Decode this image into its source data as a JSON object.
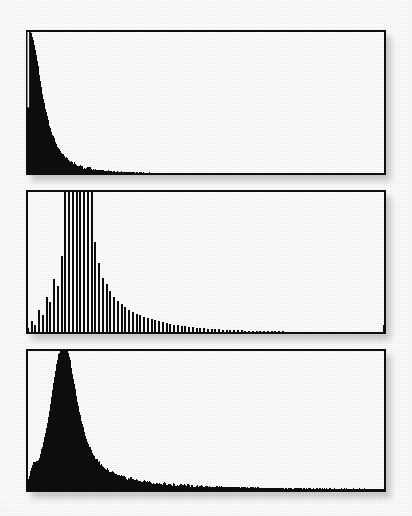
{
  "figure": {
    "caption": "",
    "background_color": "#ffffff",
    "ink_color": "#0d0d0d",
    "panel_count": 3,
    "has_axis_labels": false,
    "has_tick_labels": false,
    "has_legend": false,
    "has_gridlines": false,
    "render_style": "scanned-halftone"
  },
  "panels": [
    {
      "id": "panel-top",
      "name": "Top panel",
      "x": 26,
      "y": 30,
      "width": 360,
      "height": 145
    },
    {
      "id": "panel-middle",
      "name": "Middle panel",
      "x": 26,
      "y": 190,
      "width": 360,
      "height": 144
    },
    {
      "id": "panel-bottom",
      "name": "Bottom panel",
      "x": 26,
      "y": 349,
      "width": 360,
      "height": 143
    }
  ],
  "chart_data": [
    {
      "type": "area",
      "id": "panel-top",
      "title": "",
      "subtitle": "",
      "xlabel": "",
      "ylabel": "",
      "xlim": [
        0,
        100
      ],
      "ylim": [
        0,
        100
      ],
      "grid": false,
      "legend": null,
      "annotations": [],
      "tick_labels_x": [],
      "tick_labels_y": [],
      "fill_color": "#0d0d0d",
      "description": "Monotone power-law / exponential decay; full-height at the left axis, falls to near zero by ~20% of the x-range, then a flat near-zero tail. A narrow white sliver separates the left axis from the first bin.",
      "x": [
        0.0,
        0.4,
        0.8,
        1.2,
        1.6,
        2.0,
        2.5,
        3.0,
        3.5,
        4.0,
        4.5,
        5.0,
        5.5,
        6.0,
        6.5,
        7.0,
        7.5,
        8.0,
        8.5,
        9.0,
        9.5,
        10.0,
        11.0,
        12.0,
        13.0,
        14.0,
        15.0,
        16.0,
        17.0,
        18.0,
        19.0,
        20.0,
        22.0,
        24.0,
        26.0,
        28.0,
        30.0,
        35.0,
        40.0,
        45.0,
        50.0,
        55.0,
        60.0,
        65.0,
        70.0,
        75.0,
        80.0,
        85.0,
        90.0,
        95.0,
        100.0
      ],
      "y": [
        100.0,
        100.0,
        100.0,
        99.0,
        97.0,
        94.0,
        89.0,
        82.0,
        74.0,
        66.0,
        58.0,
        51.0,
        45.0,
        39.5,
        34.5,
        30.5,
        27.0,
        24.0,
        21.5,
        19.0,
        17.0,
        15.2,
        12.4,
        10.2,
        8.6,
        7.3,
        6.3,
        5.5,
        4.8,
        4.3,
        3.9,
        3.5,
        3.0,
        2.6,
        2.3,
        2.1,
        1.9,
        1.6,
        1.4,
        1.3,
        1.2,
        1.1,
        1.0,
        1.0,
        0.9,
        0.9,
        1.1,
        0.9,
        0.8,
        0.8,
        0.8
      ]
    },
    {
      "type": "bar",
      "id": "panel-middle",
      "title": "",
      "subtitle": "",
      "xlabel": "",
      "ylabel": "",
      "xlim": [
        0,
        100
      ],
      "ylim": [
        0,
        100
      ],
      "grid": false,
      "legend": null,
      "annotations": [
        "several central bins are clipped at the top of the axes"
      ],
      "tick_labels_x": [],
      "tick_labels_y": [],
      "fill_color": "#0d0d0d",
      "bar_count": 96,
      "description": "Discrete thin vertical bars. Values climb from the left edge, a run of bins near x=10-16 is clipped at the top of the frame, then the distribution decays with a long thin tail that is nearly flat past the midpoint.",
      "categories": [
        0,
        1,
        2,
        3,
        4,
        5,
        6,
        7,
        8,
        9,
        10,
        11,
        12,
        13,
        14,
        15,
        16,
        17,
        18,
        19,
        20,
        21,
        22,
        23,
        24,
        25,
        26,
        27,
        28,
        29,
        30,
        31,
        32,
        33,
        34,
        35,
        36,
        37,
        38,
        39,
        40,
        41,
        42,
        43,
        44,
        45,
        46,
        47,
        48,
        49,
        50,
        51,
        52,
        53,
        54,
        55,
        56,
        57,
        58,
        59,
        60,
        61,
        62,
        63,
        64,
        65,
        66,
        67,
        68,
        69,
        70,
        71,
        72,
        73,
        74,
        75,
        76,
        77,
        78,
        79,
        80,
        81,
        82,
        83,
        84,
        85,
        86,
        87,
        88,
        89,
        90,
        91,
        92,
        93,
        94,
        95
      ],
      "values": [
        4,
        9,
        6,
        17,
        13,
        26,
        22,
        38,
        33,
        54,
        100,
        100,
        100,
        100,
        100,
        100,
        100,
        100,
        64,
        49,
        39,
        35,
        30,
        26,
        23,
        21,
        19,
        17,
        15.5,
        14,
        13,
        12,
        11,
        10.2,
        9.5,
        8.8,
        8.2,
        7.6,
        7.1,
        6.6,
        6.2,
        5.8,
        5.4,
        5.1,
        4.8,
        4.5,
        4.2,
        4.0,
        3.8,
        3.6,
        3.4,
        3.2,
        3.1,
        2.9,
        2.8,
        2.7,
        2.6,
        2.5,
        2.4,
        2.3,
        2.2,
        2.2,
        2.1,
        2.0,
        2.0,
        1.9,
        1.9,
        1.8,
        1.8,
        1.7,
        1.7,
        1.6,
        1.6,
        1.6,
        1.5,
        1.5,
        1.5,
        1.4,
        1.4,
        1.4,
        1.3,
        1.3,
        1.3,
        1.3,
        1.2,
        1.2,
        1.2,
        1.2,
        1.1,
        1.1,
        1.1,
        1.1,
        1.0,
        1.0,
        1.0,
        6.0
      ]
    },
    {
      "type": "area",
      "id": "panel-bottom",
      "title": "",
      "subtitle": "",
      "xlabel": "",
      "ylabel": "",
      "xlim": [
        0,
        100
      ],
      "ylim": [
        0,
        100
      ],
      "grid": false,
      "legend": null,
      "annotations": [
        "peak is clipped at the top of the axes"
      ],
      "tick_labels_x": [],
      "tick_labels_y": [],
      "fill_color": "#0d0d0d",
      "description": "Sharp unimodal rise from the left axis with a small ragged step near 20% height, a clipped peak just left of x=12, then a long heavy-tailed decay that flattens to a thin baseline across the right half.",
      "x": [
        0.0,
        0.6,
        1.2,
        1.8,
        2.4,
        3.0,
        3.6,
        4.2,
        4.8,
        5.4,
        6.0,
        6.6,
        7.2,
        7.8,
        8.4,
        9.0,
        9.6,
        10.2,
        10.8,
        11.4,
        12.0,
        12.6,
        13.2,
        13.8,
        14.4,
        15.0,
        16.0,
        17.0,
        18.0,
        19.0,
        20.0,
        21.0,
        22.0,
        24.0,
        26.0,
        28.0,
        30.0,
        33.0,
        36.0,
        40.0,
        45.0,
        50.0,
        55.0,
        60.0,
        65.0,
        70.0,
        75.0,
        80.0,
        85.0,
        90.0,
        95.0,
        100.0
      ],
      "y": [
        2.0,
        8.0,
        14.0,
        19.0,
        22.0,
        21.0,
        23.5,
        28.0,
        34.0,
        41.0,
        49.0,
        58.0,
        68.0,
        78.0,
        88.0,
        96.0,
        100.0,
        100.0,
        100.0,
        100.0,
        96.0,
        88.0,
        79.0,
        70.0,
        62.0,
        55.0,
        44.0,
        36.0,
        30.0,
        25.5,
        22.0,
        19.2,
        17.0,
        13.8,
        11.5,
        9.9,
        8.7,
        7.4,
        6.4,
        5.5,
        4.6,
        4.0,
        3.6,
        3.3,
        3.0,
        2.8,
        2.6,
        2.5,
        2.4,
        2.3,
        2.2,
        2.2
      ]
    }
  ]
}
